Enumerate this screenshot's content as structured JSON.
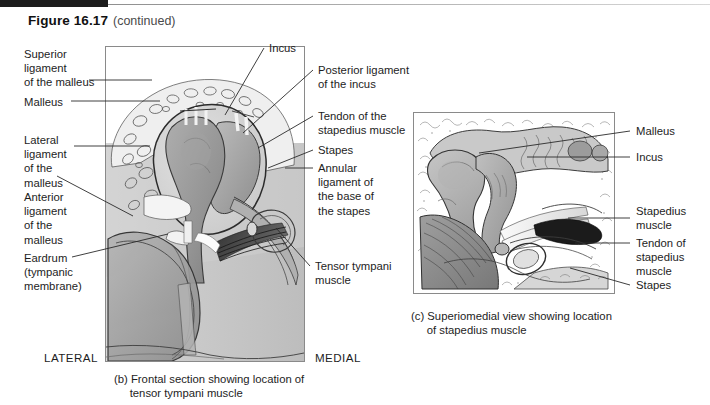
{
  "header": {
    "figure_number": "Figure 16.17",
    "continued": "(continued)"
  },
  "panel_b": {
    "orientation_left": "LATERAL",
    "orientation_right": "MEDIAL",
    "caption": "(b) Frontal section showing location of\n     tensor tympani muscle",
    "labels_left": [
      {
        "id": "superior-ligament-of-the-malleus",
        "text": "Superior\nligament\nof the malleus"
      },
      {
        "id": "malleus",
        "text": "Malleus"
      },
      {
        "id": "lateral-ligament-of-the-malleus",
        "text": "Lateral\nligament\nof the\nmalleus"
      },
      {
        "id": "anterior-ligament-of-the-malleus",
        "text": "Anterior\nligament\nof the\nmalleus"
      },
      {
        "id": "eardrum-tympanic-membrane",
        "text": "Eardrum\n(tympanic\nmembrane)"
      }
    ],
    "labels_right": [
      {
        "id": "incus",
        "text": "Incus"
      },
      {
        "id": "posterior-ligament-of-the-incus",
        "text": "Posterior ligament\nof the incus"
      },
      {
        "id": "tendon-of-the-stapedius-muscle",
        "text": "Tendon of the\nstapedius muscle"
      },
      {
        "id": "stapes",
        "text": "Stapes"
      },
      {
        "id": "annular-ligament-of-the-base-of-the-stapes",
        "text": "Annular\nligament of\nthe base of\nthe stapes"
      },
      {
        "id": "tensor-tympani-muscle",
        "text": "Tensor tympani\nmuscle"
      }
    ]
  },
  "panel_c": {
    "caption": "(c) Superiomedial view showing location\n     of stapedius muscle",
    "labels_right": [
      {
        "id": "malleus",
        "text": "Malleus"
      },
      {
        "id": "incus",
        "text": "Incus"
      },
      {
        "id": "stapedius-muscle",
        "text": "Stapedius\nmuscle"
      },
      {
        "id": "tendon-of-stapedius-muscle",
        "text": "Tendon of\nstapedius\nmuscle"
      },
      {
        "id": "stapes",
        "text": "Stapes"
      }
    ]
  },
  "colors": {
    "ink": "#1d1d1d",
    "rule": "#8a8a8a",
    "bone_light": "#b9b9b9",
    "bone_mid": "#9a9a9a",
    "bone_dark": "#6f6f6f",
    "membrane": "#a8a8a8",
    "muscle_dark": "#3a3a3a",
    "background": "#ffffff"
  }
}
